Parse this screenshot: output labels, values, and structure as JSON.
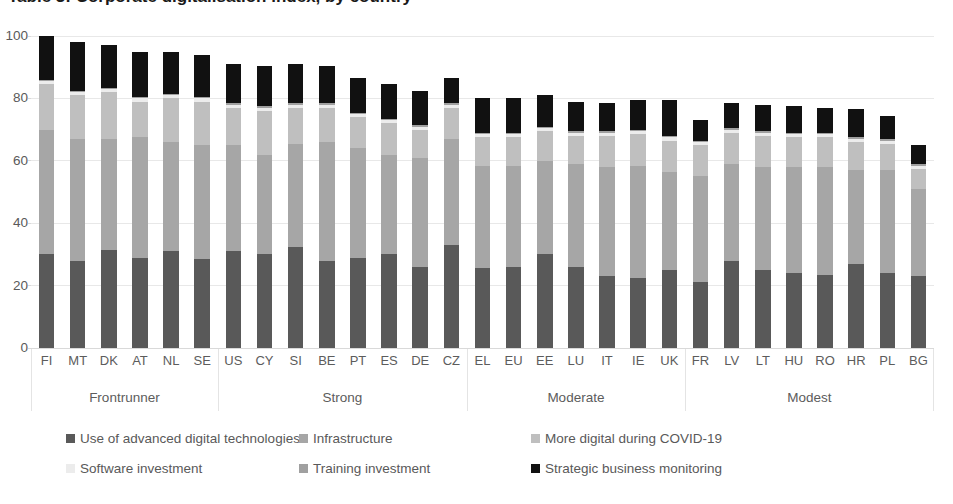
{
  "title": "Table 3: Corporate digitalisation index, by country",
  "axis": {
    "y_ticks": [
      "0",
      "20",
      "40",
      "60",
      "80",
      "100"
    ],
    "y_min": 0,
    "y_max": 100
  },
  "groups": [
    {
      "label": "Frontrunner",
      "count": 6
    },
    {
      "label": "Strong",
      "count": 8
    },
    {
      "label": "Moderate",
      "count": 7
    },
    {
      "label": "Modest",
      "count": 8
    }
  ],
  "legend": {
    "row1": [
      {
        "label": "Use of advanced digital technologies",
        "color": "#595959"
      },
      {
        "label": "Infrastructure",
        "color": "#a6a6a6"
      },
      {
        "label": "More digital during COVID-19",
        "color": "#bfbfbf"
      }
    ],
    "row2": [
      {
        "label": "Software investment",
        "color": "#ececec"
      },
      {
        "label": "Training investment",
        "color": "#a0a0a0"
      },
      {
        "label": "Strategic business monitoring",
        "color": "#111111"
      }
    ]
  },
  "chart_data": {
    "type": "bar",
    "title": "Table 3: Corporate digitalisation index, by country",
    "xlabel": "",
    "ylabel": "",
    "ylim": [
      0,
      100
    ],
    "grid": true,
    "stacked": true,
    "legend_position": "bottom",
    "categories": [
      "FI",
      "MT",
      "DK",
      "AT",
      "NL",
      "SE",
      "US",
      "CY",
      "SI",
      "BE",
      "PT",
      "ES",
      "DE",
      "CZ",
      "EL",
      "EU",
      "EE",
      "LU",
      "IT",
      "IE",
      "UK",
      "FR",
      "LV",
      "LT",
      "HU",
      "RO",
      "HR",
      "PL",
      "BG"
    ],
    "series": [
      {
        "name": "Use of advanced digital technologies",
        "color": "#595959",
        "values": [
          30,
          28,
          31.5,
          29,
          31,
          28.5,
          31,
          30,
          32.5,
          28,
          29,
          30,
          26,
          33,
          25.5,
          26,
          30,
          26,
          23,
          22.5,
          25,
          21,
          28,
          25,
          24,
          23.5,
          27,
          24,
          23
        ]
      },
      {
        "name": "Infrastructure",
        "color": "#a6a6a6",
        "values": [
          40,
          39,
          35.5,
          38.5,
          35,
          36.5,
          34,
          32,
          33,
          38,
          35,
          32,
          35,
          34,
          33,
          32.5,
          30,
          33,
          35,
          36,
          31.5,
          34,
          31,
          33,
          34,
          34.5,
          30,
          33,
          28
        ]
      },
      {
        "name": "More digital during COVID-19",
        "color": "#bfbfbf",
        "values": [
          14.5,
          14,
          15,
          11.5,
          14,
          14,
          12,
          14,
          11.5,
          11,
          10,
          10,
          9,
          10,
          9,
          9,
          9.5,
          9,
          10,
          10,
          10,
          10,
          10,
          10,
          9.5,
          9.5,
          9,
          8.5,
          6.5
        ]
      },
      {
        "name": "Software investment",
        "color": "#ececec",
        "values": [
          1,
          1,
          1,
          1,
          1,
          1,
          1,
          1,
          1,
          1,
          1,
          1,
          1,
          1,
          1,
          1,
          1,
          1,
          1,
          1,
          1,
          1,
          1,
          1,
          1,
          1,
          1,
          1,
          1
        ]
      },
      {
        "name": "Training investment",
        "color": "#a0a0a0",
        "values": [
          0.5,
          0.5,
          0.5,
          0.5,
          0.5,
          0.5,
          0.5,
          0.5,
          0.5,
          0.5,
          0.5,
          0.5,
          0.5,
          0.5,
          0.5,
          0.5,
          0.5,
          0.5,
          0.5,
          0.5,
          0.5,
          0.5,
          0.5,
          0.5,
          0.5,
          0.5,
          0.5,
          0.5,
          0.5
        ]
      },
      {
        "name": "Strategic business monitoring",
        "color": "#111111",
        "values": [
          14,
          15.5,
          13.5,
          14.5,
          13.5,
          13.5,
          12.5,
          13,
          12.5,
          12,
          11,
          11,
          11,
          8,
          11,
          11,
          10,
          9.5,
          9,
          9.5,
          11.5,
          6.5,
          8,
          8.5,
          8.5,
          8,
          9,
          7.5,
          6
        ]
      }
    ],
    "totals": [
      100,
      98,
      97,
      95,
      95,
      94,
      91,
      90.5,
      91,
      90.5,
      86.5,
      84.5,
      82.5,
      86,
      79.5,
      79,
      81,
      79,
      78.5,
      79.5,
      79.5,
      73,
      78.5,
      78,
      77.5,
      77,
      76.5,
      74.5,
      65
    ]
  }
}
